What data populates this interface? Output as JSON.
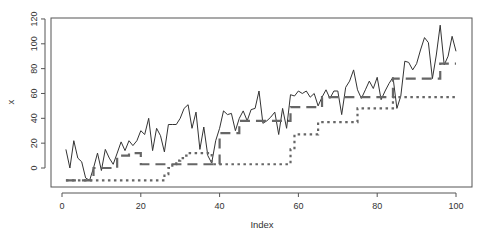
{
  "chart_data": {
    "type": "line",
    "title": "",
    "xlabel": "Index",
    "ylabel": "x",
    "xlim": [
      -2,
      104
    ],
    "ylim": [
      -14,
      122
    ],
    "xticks": [
      0,
      20,
      40,
      60,
      80,
      100
    ],
    "yticks": [
      0,
      20,
      40,
      60,
      80,
      100,
      120
    ],
    "grid": false,
    "legend": null,
    "x": [
      1,
      2,
      3,
      4,
      5,
      6,
      7,
      8,
      9,
      10,
      11,
      12,
      13,
      14,
      15,
      16,
      17,
      18,
      19,
      20,
      21,
      22,
      23,
      24,
      25,
      26,
      27,
      28,
      29,
      30,
      31,
      32,
      33,
      34,
      35,
      36,
      37,
      38,
      39,
      40,
      41,
      42,
      43,
      44,
      45,
      46,
      47,
      48,
      49,
      50,
      51,
      52,
      53,
      54,
      55,
      56,
      57,
      58,
      59,
      60,
      61,
      62,
      63,
      64,
      65,
      66,
      67,
      68,
      69,
      70,
      71,
      72,
      73,
      74,
      75,
      76,
      77,
      78,
      79,
      80,
      81,
      82,
      83,
      84,
      85,
      86,
      87,
      88,
      89,
      90,
      91,
      92,
      93,
      94,
      95,
      96,
      97,
      98,
      99,
      100
    ],
    "series": [
      {
        "name": "x",
        "style": "solid",
        "color": "#333333",
        "values": [
          15,
          0,
          22,
          8,
          5,
          -8,
          -10,
          0,
          12,
          -2,
          15,
          8,
          3,
          12,
          21,
          14,
          22,
          18,
          22,
          30,
          27,
          40,
          14,
          32,
          26,
          13,
          35,
          35,
          35,
          40,
          48,
          51,
          32,
          45,
          15,
          33,
          10,
          4,
          22,
          32,
          46,
          43,
          44,
          30,
          40,
          46,
          38,
          47,
          48,
          62,
          36,
          38,
          41,
          45,
          27,
          48,
          32,
          59,
          58,
          62,
          60,
          62,
          57,
          60,
          50,
          57,
          63,
          56,
          62,
          62,
          43,
          65,
          70,
          79,
          63,
          56,
          63,
          70,
          64,
          73,
          55,
          62,
          68,
          73,
          48,
          58,
          86,
          85,
          79,
          84,
          95,
          105,
          101,
          72,
          91,
          115,
          83,
          90,
          106,
          94
        ]
      },
      {
        "name": "step-dashed",
        "style": "dashed",
        "color": "#666666",
        "values": [
          -10,
          -10,
          -10,
          -10,
          -10,
          -10,
          -10,
          0,
          0,
          0,
          0,
          0,
          0,
          10,
          10,
          10,
          12,
          12,
          12,
          3,
          3,
          3,
          3,
          3,
          3,
          3,
          3,
          3,
          3,
          3,
          3,
          3,
          3,
          3,
          3,
          3,
          3,
          3,
          3,
          28,
          28,
          28,
          28,
          28,
          38,
          38,
          38,
          38,
          38,
          38,
          38,
          38,
          38,
          38,
          38,
          38,
          38,
          49,
          49,
          49,
          49,
          49,
          49,
          49,
          49,
          57,
          57,
          57,
          57,
          57,
          57,
          57,
          57,
          57,
          57,
          57,
          57,
          57,
          57,
          57,
          57,
          57,
          57,
          72,
          72,
          72,
          72,
          72,
          72,
          72,
          72,
          72,
          72,
          72,
          72,
          84,
          84,
          84,
          84,
          84
        ]
      },
      {
        "name": "step-dotted",
        "style": "dotted",
        "color": "#666666",
        "values": [
          -10,
          -10,
          -10,
          -10,
          -10,
          -10,
          -10,
          -10,
          -10,
          -10,
          -10,
          -10,
          -10,
          -10,
          -10,
          -10,
          -10,
          -10,
          -10,
          -10,
          -10,
          -10,
          -10,
          -10,
          -10,
          -5,
          0,
          3,
          6,
          8,
          10,
          12,
          12,
          12,
          12,
          12,
          12,
          3,
          3,
          3,
          3,
          3,
          3,
          3,
          3,
          3,
          3,
          3,
          3,
          3,
          3,
          3,
          3,
          3,
          3,
          3,
          3,
          15,
          27,
          27,
          27,
          27,
          27,
          27,
          37,
          37,
          37,
          37,
          37,
          37,
          37,
          37,
          37,
          37,
          48,
          48,
          48,
          48,
          48,
          48,
          48,
          48,
          48,
          57,
          57,
          57,
          57,
          57,
          57,
          57,
          57,
          57,
          57,
          57,
          57,
          57,
          57,
          57,
          57,
          57
        ]
      }
    ]
  },
  "layout": {
    "plot": {
      "left": 51,
      "top": 18,
      "right": 472,
      "bottom": 187
    },
    "xmap": {
      "origin_px": 62,
      "px_per_unit": 3.94
    },
    "ymap": {
      "origin_px": 168,
      "px_per_unit": 1.242
    },
    "axis_color": "#555555"
  }
}
